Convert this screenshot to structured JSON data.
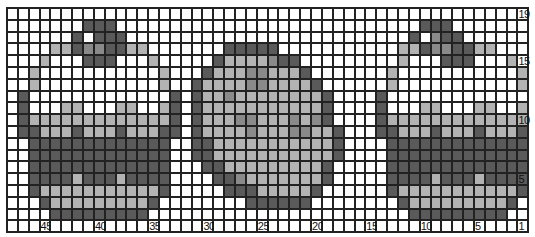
{
  "chart": {
    "title_clipped": "",
    "columns": 48,
    "rows": 19,
    "palette": {
      "0": "#ffffff",
      "1": "#b3b3b3",
      "2": "#8a8a8a",
      "3": "#5a5a5a"
    },
    "legend_meaning": {
      "0": "white",
      "1": "light-gray",
      "2": "mid-gray",
      "3": "dark-gray"
    },
    "row_pattern_top_to_bottom": [
      "000000000000000000000000000000000000000000000000",
      "000000033300000000000000000000000000003330000000",
      "000000303330000000000000000000000000030233000000",
      "000011322331100000003333300000000000113223311000",
      "000100033300010000031111233000000000100033300010",
      "001000000000001000311122111300000001000000000001",
      "001000000000001003111122111130000001000000000001",
      "030000000000000303112111111113000030000000000000",
      "030001100011001303111111111113000030001100011001",
      "031111111111111303111221112123000031111111111111",
      "033111311131113303111121112211300033111311131113",
      "003333333333333003311111111111300003333333333333",
      "003333333333333003311111111111300003333333333333",
      "003333333333333000331111111113000003333333333333",
      "003333133313333000033211111113000003333133313333",
      "003111111111113000003331111130000003111111111113",
      "000311111111130000000033333300000000311111111130",
      "000033333333300000000000000000000000033333333300",
      "000000000000000000000000000000000000000000000000"
    ],
    "column_labels": [
      {
        "col_index": 3,
        "text": "45"
      },
      {
        "col_index": 8,
        "text": "40"
      },
      {
        "col_index": 13,
        "text": "35"
      },
      {
        "col_index": 18,
        "text": "30"
      },
      {
        "col_index": 23,
        "text": "25"
      },
      {
        "col_index": 28,
        "text": "20"
      },
      {
        "col_index": 33,
        "text": "15"
      },
      {
        "col_index": 38,
        "text": "10"
      },
      {
        "col_index": 43,
        "text": "5"
      },
      {
        "col_index": 47,
        "text": "1"
      }
    ],
    "row_labels": [
      {
        "row_index": 0,
        "text": "19"
      },
      {
        "row_index": 4,
        "text": "15"
      },
      {
        "row_index": 9,
        "text": "10"
      },
      {
        "row_index": 14,
        "text": "5"
      }
    ],
    "motifs": [
      "cupcake-left",
      "cookie-center",
      "cupcake-right"
    ]
  }
}
